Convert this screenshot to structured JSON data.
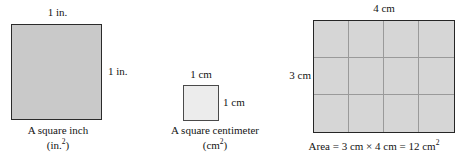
{
  "figure": {
    "colors": {
      "square_inch_fill": "#c9c9c9",
      "square_cm_fill": "#ececec",
      "grid_fill": "#d6d6d6",
      "grid_line": "#9a9a9a",
      "border_dark": "#262626",
      "text": "#141414",
      "background": "#ffffff"
    }
  },
  "panels": {
    "square_inch": {
      "top_label": "1 in.",
      "side_label": "1 in.",
      "caption_line1": "A square inch",
      "caption_line2_base": "(in.",
      "caption_line2_exp": "2",
      "caption_line2_close": ")"
    },
    "square_centimeter": {
      "top_label": "1 cm",
      "side_label": "1 cm",
      "caption_line1": "A square centimeter",
      "caption_line2_base": "(cm",
      "caption_line2_exp": "2",
      "caption_line2_close": ")"
    },
    "area_grid": {
      "top_label": "4 cm",
      "side_label": "3 cm",
      "columns": 4,
      "rows": 3,
      "caption_base": "Area = 3 cm × 4 cm = 12 cm",
      "caption_exp": "2"
    }
  },
  "chart_data": {
    "type": "diagram",
    "items": [
      {
        "name": "square inch",
        "width_label": "1 in.",
        "height_label": "1 in.",
        "unit": "in.",
        "area_value": 1,
        "area_unit": "in.²",
        "subdivisions": 1
      },
      {
        "name": "square centimeter",
        "width_label": "1 cm",
        "height_label": "1 cm",
        "unit": "cm",
        "area_value": 1,
        "area_unit": "cm²",
        "subdivisions": 1
      },
      {
        "name": "rectangle area example",
        "width_label": "4 cm",
        "height_label": "3 cm",
        "unit": "cm",
        "width_value": 4,
        "height_value": 3,
        "area_value": 12,
        "area_unit": "cm²",
        "subdivisions": 12,
        "equation": "Area = 3 cm × 4 cm = 12 cm²"
      }
    ]
  }
}
